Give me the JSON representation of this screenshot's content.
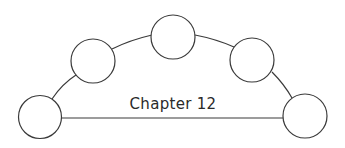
{
  "diagram": {
    "title": "Chapter 12",
    "stroke_color": "#3a3a3a",
    "background": "#ffffff",
    "nodes": [
      {
        "id": "node-1",
        "cx": 40,
        "cy": 117,
        "r": 21,
        "label": ""
      },
      {
        "id": "node-2",
        "cx": 93,
        "cy": 61,
        "r": 22,
        "label": ""
      },
      {
        "id": "node-3",
        "cx": 173,
        "cy": 37,
        "r": 22,
        "label": ""
      },
      {
        "id": "node-4",
        "cx": 252,
        "cy": 60,
        "r": 22,
        "label": ""
      },
      {
        "id": "node-5",
        "cx": 305,
        "cy": 116,
        "r": 22,
        "label": ""
      }
    ]
  }
}
